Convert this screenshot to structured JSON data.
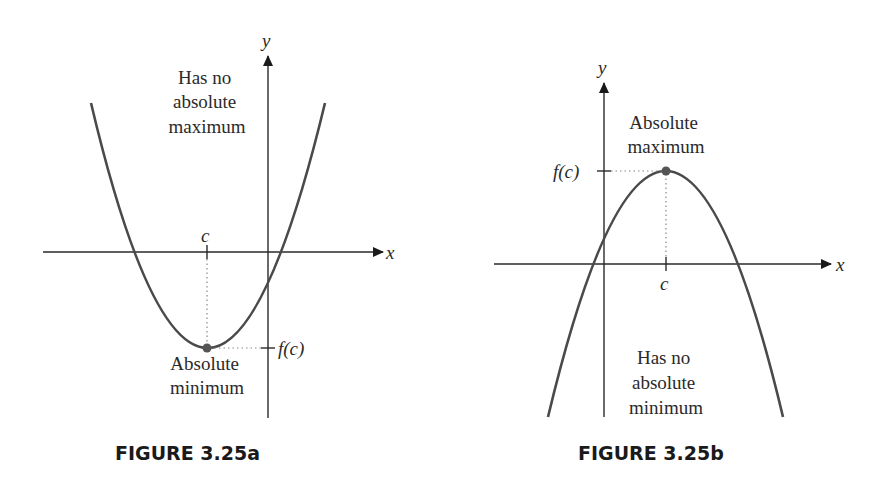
{
  "figures": [
    {
      "caption": "FIGURE 3.25a",
      "axis_x_label": "x",
      "axis_y_label": "y",
      "tick_x_label": "c",
      "tick_y_label": "f(c)",
      "top_note": [
        "Has no",
        "absolute",
        "maximum"
      ],
      "point_note": [
        "Absolute",
        "minimum"
      ],
      "curve": "upward-opening parabola with minimum at (c, f(c))"
    },
    {
      "caption": "FIGURE 3.25b",
      "axis_x_label": "x",
      "axis_y_label": "y",
      "tick_x_label": "c",
      "tick_y_label": "f(c)",
      "point_note": [
        "Absolute",
        "maximum"
      ],
      "bottom_note": [
        "Has no",
        "absolute",
        "minimum"
      ],
      "curve": "downward-opening parabola with maximum at (c, f(c))"
    }
  ],
  "colors": {
    "curve": "#4a4a4a",
    "axes": "#2a2a2a",
    "point": "#555555"
  }
}
